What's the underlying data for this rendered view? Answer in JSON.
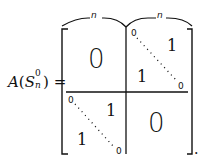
{
  "equation": {
    "lhs": {
      "function": "A",
      "open_paren": "(",
      "symbol": "S",
      "superscript": "0",
      "subscript": "n",
      "close_paren": ")",
      "equals": "="
    },
    "braces": [
      {
        "label": "n"
      },
      {
        "label": "n"
      }
    ],
    "blocks": {
      "top_left": {
        "value": "0"
      },
      "top_right": {
        "corner_top": "0",
        "corner_bottom": "0",
        "upper": "1",
        "lower": "1"
      },
      "bottom_left": {
        "corner_top": "0",
        "corner_bottom": "0",
        "upper": "1",
        "lower": "1"
      },
      "bottom_right": {
        "value": "0"
      }
    },
    "trailing_punctuation": "."
  }
}
